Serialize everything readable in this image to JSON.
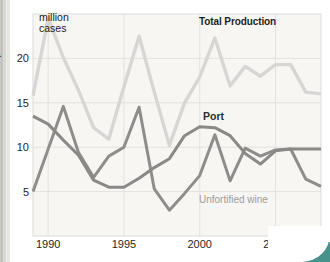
{
  "page": {
    "cropped_left_text": "t",
    "y_axis_title": "million\ncases"
  },
  "chart_data": {
    "type": "line",
    "title": "",
    "xlabel": "",
    "ylabel": "million cases",
    "xlim": [
      1989,
      2008
    ],
    "ylim": [
      0,
      25
    ],
    "x_ticks": [
      1990,
      1995,
      2000,
      2005
    ],
    "y_ticks": [
      5,
      10,
      15,
      20
    ],
    "grid": true,
    "legend_position": "direct-labels-on-chart",
    "years": [
      1989,
      1990,
      1991,
      1992,
      1993,
      1994,
      1995,
      1996,
      1997,
      1998,
      1999,
      2000,
      2001,
      2002,
      2003,
      2004,
      2005,
      2006,
      2007,
      2008
    ],
    "series": [
      {
        "name": "Total Production",
        "color": "#d7d6d4",
        "width": 3.4,
        "values": [
          15.8,
          24.5,
          20.1,
          16.4,
          12.2,
          10.9,
          16.8,
          22.5,
          16.2,
          10.2,
          15.0,
          17.9,
          22.3,
          16.9,
          19.1,
          18.0,
          19.3,
          19.3,
          16.2,
          16.0
        ]
      },
      {
        "name": "Unfortified wine",
        "color": "#8e8d8b",
        "width": 3,
        "values": [
          5.0,
          9.8,
          14.6,
          9.4,
          6.6,
          9.0,
          10.0,
          14.5,
          5.3,
          2.9,
          4.8,
          6.8,
          11.4,
          6.2,
          9.9,
          9.0,
          9.7,
          9.8,
          6.4,
          5.6
        ]
      },
      {
        "name": "Port",
        "color": "#8a8988",
        "width": 3,
        "values": [
          13.5,
          12.6,
          10.8,
          9.1,
          6.3,
          5.5,
          5.5,
          6.5,
          7.7,
          8.7,
          11.3,
          12.3,
          12.2,
          11.3,
          9.3,
          8.1,
          9.6,
          9.8,
          9.8,
          9.8
        ]
      }
    ],
    "colors": {
      "plot_background": "#f7f6f3",
      "grid_line": "#e4e2df",
      "plot_border": "#dcdcdc",
      "tick_text": "#262626",
      "desktop_teal": "#47938b"
    }
  }
}
